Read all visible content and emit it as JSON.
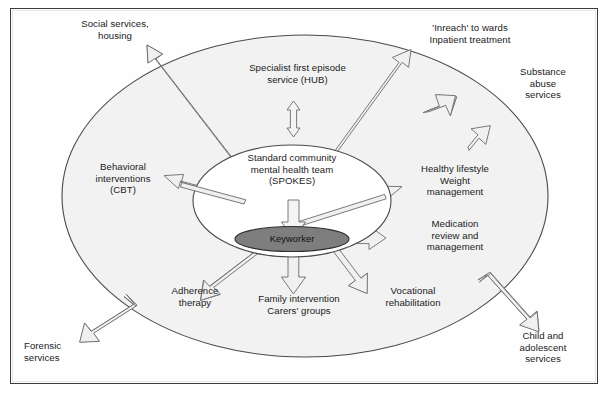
{
  "figure": {
    "frame_border_color": "#3b3b3b",
    "outer_circle_fill": "#f2f2f2",
    "outer_circle_stroke": "#4a4a4a",
    "spokes_ellipse_fill": "#ffffff",
    "spokes_ellipse_stroke": "#4a4a4a",
    "keyworker_ellipse_fill": "#7e7e7e",
    "keyworker_ellipse_stroke": "#2e2e2e",
    "arrow_fill": "#f0f0f0",
    "arrow_stroke": "#6b6b6b",
    "background": "#ffffff"
  },
  "core": {
    "hub_label": "Standard community\nmental health team\n(SPOKES)",
    "hub_line1": "Standard community",
    "hub_line2": "mental health team",
    "hub_line3": "(SPOKES)",
    "keyworker_label": "Keyworker"
  },
  "nodes": [
    {
      "id": "social-services",
      "line1": "Social services,",
      "line2": "housing",
      "line3": "",
      "position": "outside-top-left",
      "arrow": "outward",
      "arrow_style": "long-thin"
    },
    {
      "id": "specialist-first-episode",
      "line1": "Specialist first episode",
      "line2": "service (HUB)",
      "line3": "",
      "position": "inside-top-center",
      "arrow": "bidirectional",
      "arrow_style": "vertical-double"
    },
    {
      "id": "inreach-inpatient",
      "line1": "'Inreach' to wards",
      "line2": "Inpatient treatment",
      "line3": "",
      "position": "outside-top-right",
      "arrow": "outward",
      "arrow_style": "long-thin-and-short"
    },
    {
      "id": "substance-abuse",
      "line1": "Substance",
      "line2": "abuse",
      "line3": "services",
      "position": "outside-right-upper",
      "arrow": "outward",
      "arrow_style": "short"
    },
    {
      "id": "behavioral-cbt",
      "line1": "Behavioral",
      "line2": "interventions",
      "line3": "(CBT)",
      "position": "inside-left",
      "arrow": "outward",
      "arrow_style": "long-thin"
    },
    {
      "id": "healthy-lifestyle",
      "line1": "Healthy lifestyle",
      "line2": "Weight",
      "line3": "management",
      "position": "inside-right-upper",
      "arrow": "outward",
      "arrow_style": "long-thin"
    },
    {
      "id": "medication-review",
      "line1": "Medication",
      "line2": "review and",
      "line3": "management",
      "position": "inside-right",
      "arrow": "outward",
      "arrow_style": "horizontal"
    },
    {
      "id": "forensic-services",
      "line1": "Forensic",
      "line2": "services",
      "line3": "",
      "position": "outside-bottom-left",
      "arrow": "outward",
      "arrow_style": "short"
    },
    {
      "id": "adherence-therapy",
      "line1": "Adherence",
      "line2": "therapy",
      "line3": "",
      "position": "inside-bottom-left",
      "arrow": "outward",
      "arrow_style": "short"
    },
    {
      "id": "family-intervention",
      "line1": "Family intervention",
      "line2": "Carers' groups",
      "line3": "",
      "position": "inside-bottom-center",
      "arrow": "outward",
      "arrow_style": "vertical"
    },
    {
      "id": "vocational-rehab",
      "line1": "Vocational",
      "line2": "rehabilitation",
      "line3": "",
      "position": "inside-bottom-right",
      "arrow": "outward",
      "arrow_style": "short"
    },
    {
      "id": "child-adolescent",
      "line1": "Child and",
      "line2": "adolescent",
      "line3": "services",
      "position": "outside-bottom-right",
      "arrow": "outward",
      "arrow_style": "short"
    }
  ]
}
